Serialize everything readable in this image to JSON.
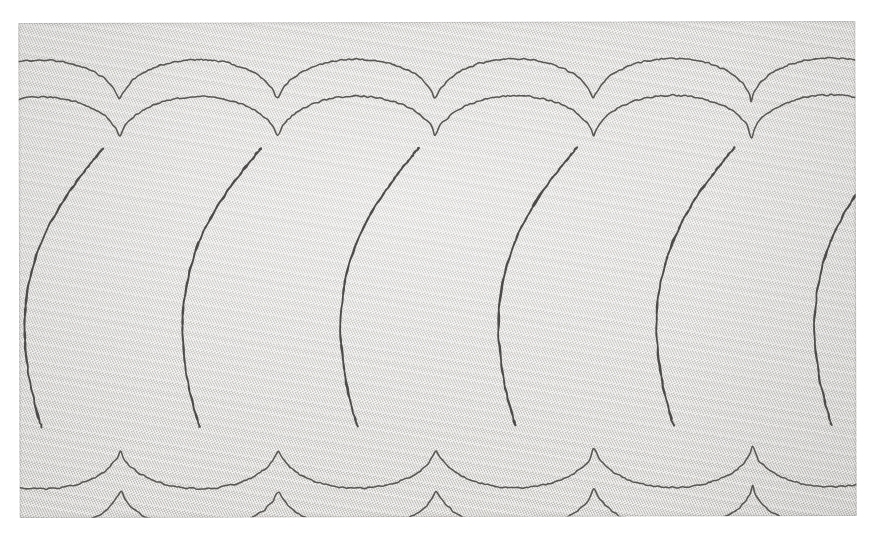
{
  "image": {
    "subject": "stitched-fabric-swatch",
    "description": "Photograph of a light grey twill fabric swatch embroidered with a repeating row of teardrop (pear) shaped running-stitch outlines",
    "canvas": {
      "width": 873,
      "height": 545,
      "background_color": "#ffffff"
    }
  },
  "swatch": {
    "x": 19,
    "y": 22,
    "width": 837,
    "height": 495,
    "fabric_color": "#dddbd8",
    "weave": "twill",
    "weave_angle_deg": 66,
    "tilt_deg": -0.15
  },
  "stitching": {
    "thread_color": "#4d4b49",
    "thread_color_secondary": "#585653",
    "thread_color_faint": "#63615e",
    "stitch_width_px": 1.7,
    "motif": "teardrop",
    "rows": 3,
    "row_labels": [
      "upper-partial-row",
      "main-teardrop-row",
      "lower-partial-row"
    ],
    "period_px": 158,
    "motif_count_main_row": 6,
    "orientation_main_row": "point-down",
    "orientation_upper_row": "point-up",
    "orientation_lower_row": "point-up"
  },
  "geometry": {
    "main_row": {
      "bulb_center_y": 200,
      "bulb_rx": 62,
      "bulb_ry": 74,
      "tip_y": 404,
      "centers_x": [
        22,
        180,
        338,
        496,
        654,
        812
      ]
    },
    "upper_row": {
      "arc_bottom_y": 112,
      "cusp_y": 120,
      "centers_x": [
        -57,
        101,
        259,
        417,
        575,
        733,
        891
      ]
    },
    "upper_row_2": {
      "arc_bottom_y": 75,
      "cusp_y": 83,
      "centers_x": [
        -57,
        101,
        259,
        417,
        575,
        733,
        891
      ]
    },
    "lower_row": {
      "arc_top_y": 430,
      "cusp_y": 422,
      "centers_x": [
        -57,
        101,
        259,
        417,
        575,
        733,
        891
      ]
    },
    "lower_row_2": {
      "arc_top_y": 470,
      "cusp_y": 462,
      "centers_x": [
        -57,
        101,
        259,
        417,
        575,
        733,
        891
      ]
    }
  },
  "chart_data": {
    "type": "line",
    "title": "",
    "xlabel": "",
    "ylabel": "",
    "grid": false,
    "legend": "none",
    "xlim": [
      0,
      837
    ],
    "ylim": [
      0,
      495
    ],
    "series": [
      {
        "name": "upper-scallop-band-1",
        "values": []
      },
      {
        "name": "upper-scallop-band-2",
        "values": []
      },
      {
        "name": "main-teardrops",
        "values": []
      },
      {
        "name": "lower-scallop-band-1",
        "values": []
      },
      {
        "name": "lower-scallop-band-2",
        "values": []
      }
    ]
  }
}
